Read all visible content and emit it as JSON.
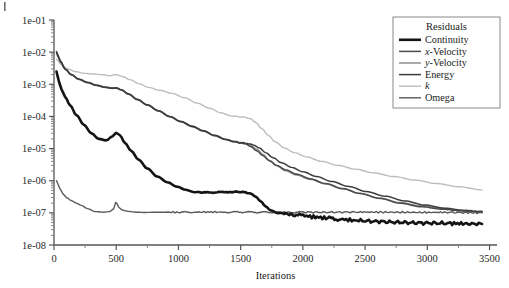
{
  "chart_data": {
    "type": "line",
    "title": "",
    "xlabel": "Iterations",
    "ylabel": "",
    "yscale": "log",
    "xlim": [
      0,
      3560
    ],
    "ylim": [
      1e-08,
      0.1
    ],
    "grid": false,
    "legend": {
      "title": "Residuals",
      "position": "top-right",
      "entries": [
        {
          "name": "Continuity",
          "color": "#141414",
          "width": 2.6,
          "italic_prefix": ""
        },
        {
          "name": "x-Velocity",
          "color": "#4a4a4a",
          "width": 1.5,
          "italic_prefix": "x"
        },
        {
          "name": "y-Velocity",
          "color": "#8e8e8e",
          "width": 1.5,
          "italic_prefix": "y"
        },
        {
          "name": "Energy",
          "color": "#3d3d3d",
          "width": 1.5,
          "italic_prefix": ""
        },
        {
          "name": "k",
          "color": "#bdbdbd",
          "width": 1.4,
          "italic_prefix": "k"
        },
        {
          "name": "Omega",
          "color": "#5a5a5a",
          "width": 1.4,
          "italic_prefix": ""
        }
      ]
    },
    "xticks": [
      0,
      500,
      1000,
      1500,
      2000,
      2500,
      3000,
      3500
    ],
    "xticklabels": [
      "0",
      "500",
      "1000",
      "1500",
      "2000",
      "2500",
      "3000",
      "3500"
    ],
    "xminorticks": [
      250,
      750,
      1250,
      1750,
      2250,
      2750,
      3250
    ],
    "yticks": [
      0.1,
      0.01,
      0.001,
      0.0001,
      1e-05,
      1e-06,
      1e-07,
      1e-08
    ],
    "yticklabels": [
      "1e-01",
      "1e-02",
      "1e-03",
      "1e-04",
      "1e-05",
      "1e-06",
      "1e-07",
      "1e-08"
    ],
    "series": [
      {
        "name": "Continuity",
        "x": [
          20,
          40,
          60,
          90,
          130,
          180,
          240,
          300,
          360,
          420,
          470,
          500,
          530,
          570,
          620,
          680,
          750,
          830,
          910,
          990,
          1060,
          1120,
          1180,
          1260,
          1340,
          1420,
          1480,
          1530,
          1580,
          1620,
          1660,
          1700,
          1740,
          1790,
          1850,
          1920,
          2000,
          2100,
          2200,
          2320,
          2450,
          2600,
          2750,
          2900,
          3050,
          3200,
          3330,
          3440
        ],
        "y": [
          0.0025,
          0.0012,
          0.0007,
          0.0004,
          0.00022,
          0.00011,
          5.5e-05,
          3e-05,
          2e-05,
          1.8e-05,
          2.4e-05,
          3.1e-05,
          2.6e-05,
          1.5e-05,
          8.5e-06,
          4.5e-06,
          2.4e-06,
          1.35e-06,
          9e-07,
          6.5e-07,
          5.2e-07,
          4.5e-07,
          4.3e-07,
          4.3e-07,
          4.4e-07,
          4.5e-07,
          4.5e-07,
          4.4e-07,
          4e-07,
          3.2e-07,
          2.3e-07,
          1.6e-07,
          1.2e-07,
          1.02e-07,
          9.4e-08,
          8.8e-08,
          8.2e-08,
          7.4e-08,
          6.8e-08,
          6.2e-08,
          5.7e-08,
          5.4e-08,
          5.1e-08,
          4.9e-08,
          4.8e-08,
          4.7e-08,
          4.6e-08,
          4.5e-08
        ]
      },
      {
        "name": "x-Velocity",
        "x": [
          20,
          50,
          90,
          140,
          200,
          270,
          340,
          410,
          470,
          500,
          540,
          600,
          670,
          750,
          840,
          930,
          1020,
          1110,
          1200,
          1290,
          1380,
          1450,
          1500,
          1540,
          1580,
          1630,
          1680,
          1730,
          1790,
          1860,
          1950,
          2060,
          2180,
          2320,
          2460,
          2620,
          2780,
          2950,
          3120,
          3280,
          3440
        ],
        "y": [
          0.0105,
          0.0055,
          0.003,
          0.002,
          0.00145,
          0.00115,
          0.00095,
          0.00082,
          0.00076,
          0.00078,
          0.00068,
          0.0005,
          0.00034,
          0.00023,
          0.00015,
          0.0001,
          7e-05,
          5e-05,
          3.6e-05,
          2.6e-05,
          1.95e-05,
          1.65e-05,
          1.55e-05,
          1.4e-05,
          1.15e-05,
          8.5e-06,
          6e-06,
          4.2e-06,
          3e-06,
          2.2e-06,
          1.6e-06,
          1.15e-06,
          8.2e-07,
          5.7e-07,
          4e-07,
          2.8e-07,
          2e-07,
          1.55e-07,
          1.3e-07,
          1.15e-07,
          1.08e-07
        ]
      },
      {
        "name": "y-Velocity",
        "x": [
          20,
          50,
          90,
          140,
          200,
          270,
          340,
          410,
          470,
          500,
          540,
          600,
          670,
          750,
          840,
          930,
          1020,
          1110,
          1200,
          1290,
          1380,
          1450,
          1500,
          1540,
          1580,
          1630,
          1680,
          1730,
          1790,
          1860,
          1950,
          2060,
          2180,
          2320,
          2460,
          2620,
          2780,
          2950,
          3120,
          3280,
          3440
        ],
        "y": [
          0.009,
          0.005,
          0.0029,
          0.00195,
          0.00142,
          0.00112,
          0.00092,
          0.0008,
          0.00074,
          0.00076,
          0.00066,
          0.00049,
          0.00033,
          0.000225,
          0.000148,
          9.8e-05,
          6.8e-05,
          4.8e-05,
          3.5e-05,
          2.5e-05,
          1.9e-05,
          1.6e-05,
          1.5e-05,
          1.42e-05,
          1.25e-05,
          9.5e-06,
          6.5e-06,
          4.3e-06,
          2.9e-06,
          2.05e-06,
          1.5e-06,
          1.1e-06,
          8e-07,
          5.6e-07,
          4e-07,
          2.85e-07,
          2.1e-07,
          1.65e-07,
          1.38e-07,
          1.2e-07,
          1.12e-07
        ]
      },
      {
        "name": "Energy",
        "x": [
          20,
          50,
          90,
          140,
          200,
          270,
          340,
          410,
          470,
          500,
          540,
          600,
          670,
          750,
          840,
          930,
          1020,
          1110,
          1200,
          1290,
          1380,
          1450,
          1500,
          1550,
          1600,
          1650,
          1700,
          1760,
          1830,
          1910,
          2000,
          2110,
          2230,
          2370,
          2510,
          2660,
          2820,
          2980,
          3140,
          3300,
          3440
        ],
        "y": [
          0.01,
          0.0052,
          0.00295,
          0.00198,
          0.00143,
          0.00113,
          0.00093,
          0.00081,
          0.00075,
          0.00077,
          0.00067,
          0.000495,
          0.000335,
          0.000228,
          0.000149,
          9.9e-05,
          6.9e-05,
          4.9e-05,
          3.55e-05,
          2.55e-05,
          1.92e-05,
          1.62e-05,
          1.52e-05,
          1.45e-05,
          1.3e-05,
          1.05e-05,
          7.5e-06,
          5.2e-06,
          3.6e-06,
          2.6e-06,
          1.9e-06,
          1.35e-06,
          9.5e-07,
          6.6e-07,
          4.6e-07,
          3.3e-07,
          2.35e-07,
          1.75e-07,
          1.4e-07,
          1.18e-07,
          1.05e-07
        ]
      },
      {
        "name": "k",
        "x": [
          20,
          60,
          110,
          170,
          240,
          310,
          380,
          450,
          500,
          550,
          610,
          680,
          760,
          850,
          950,
          1050,
          1150,
          1250,
          1340,
          1420,
          1480,
          1530,
          1580,
          1620,
          1670,
          1720,
          1780,
          1850,
          1930,
          2030,
          2150,
          2280,
          2420,
          2570,
          2730,
          2900,
          3070,
          3250,
          3440
        ],
        "y": [
          0.006,
          0.004,
          0.003,
          0.0025,
          0.0022,
          0.0021,
          0.002,
          0.00185,
          0.002,
          0.00175,
          0.0014,
          0.00105,
          0.0008,
          0.00065,
          0.00052,
          0.00038,
          0.00026,
          0.00018,
          0.00013,
          0.000105,
          9.8e-05,
          9.5e-05,
          8.5e-05,
          6.5e-05,
          4.2e-05,
          2.6e-05,
          1.6e-05,
          1.05e-05,
          7.5e-06,
          5.5e-06,
          4e-06,
          3e-06,
          2.3e-06,
          1.75e-06,
          1.35e-06,
          1.05e-06,
          8.2e-07,
          6.5e-07,
          5.2e-07
        ]
      },
      {
        "name": "Omega",
        "x": [
          20,
          45,
          70,
          100,
          140,
          180,
          220,
          270,
          330,
          400,
          450,
          480,
          495,
          505,
          520,
          545,
          575,
          610,
          660,
          720,
          800,
          900,
          1000,
          1120,
          1250,
          1380,
          1500,
          1620,
          1700,
          1780,
          1880,
          2000,
          2150,
          2300,
          2450,
          2620,
          2800,
          2980,
          3150,
          3300,
          3440
        ],
        "y": [
          1e-06,
          6e-07,
          4e-07,
          3e-07,
          2.4e-07,
          2e-07,
          1.7e-07,
          1.35e-07,
          1.1e-07,
          1.05e-07,
          1.1e-07,
          1.35e-07,
          2.1e-07,
          2e-07,
          1.5e-07,
          1.25e-07,
          1.15e-07,
          1.1e-07,
          1.05e-07,
          1.03e-07,
          1.04e-07,
          1.05e-07,
          1.04e-07,
          1.05e-07,
          1.06e-07,
          1.05e-07,
          1.06e-07,
          1.05e-07,
          1.04e-07,
          1.05e-07,
          1.04e-07,
          1.05e-07,
          1.04e-07,
          1.05e-07,
          1.06e-07,
          1.05e-07,
          1.04e-07,
          1.03e-07,
          1.04e-07,
          1.02e-07,
          1e-07
        ]
      }
    ]
  }
}
